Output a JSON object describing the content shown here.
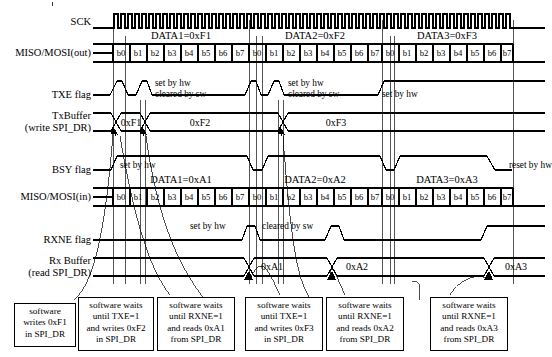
{
  "figure": {
    "type": "spi-timing-diagram"
  },
  "rows": [
    {
      "id": "sck",
      "label": "SCK",
      "sublabel": ""
    },
    {
      "id": "miso_out",
      "label": "MISO/MOSI(out)",
      "sublabel": ""
    },
    {
      "id": "txe",
      "label": "TXE flag",
      "sublabel": ""
    },
    {
      "id": "txbuffer",
      "label": "TxBuffer",
      "sublabel": "(write SPI_DR)"
    },
    {
      "id": "bsy",
      "label": "BSY flag",
      "sublabel": ""
    },
    {
      "id": "miso_in",
      "label": "MISO/MOSI(in)",
      "sublabel": ""
    },
    {
      "id": "rxne",
      "label": "RXNE flag",
      "sublabel": ""
    },
    {
      "id": "rxbuffer",
      "label": "Rx Buffer",
      "sublabel": "(read SPI_DR)"
    }
  ],
  "out_frames": [
    {
      "name": "DATA1=0xF1",
      "bits": [
        "b0",
        "b1",
        "b2",
        "b3",
        "b4",
        "b5",
        "b6",
        "b7"
      ]
    },
    {
      "name": "DATA2=0xF2",
      "bits": [
        "b0",
        "b1",
        "b2",
        "b3",
        "b4",
        "b5",
        "b6",
        "b7"
      ]
    },
    {
      "name": "DATA3=0xF3",
      "bits": [
        "b0",
        "b1",
        "b2",
        "b3",
        "b4",
        "b5",
        "b6",
        "b7"
      ]
    }
  ],
  "in_frames": [
    {
      "name": "DATA1=0xA1",
      "bits": [
        "b0",
        "b1",
        "b2",
        "b3",
        "b4",
        "b5",
        "b6",
        "b7"
      ]
    },
    {
      "name": "DATA2=0xA2",
      "bits": [
        "b0",
        "b1",
        "b2",
        "b3",
        "b4",
        "b5",
        "b6",
        "b7"
      ]
    },
    {
      "name": "DATA3=0xA3",
      "bits": [
        "b0",
        "b1",
        "b2",
        "b3",
        "b4",
        "b5",
        "b6",
        "b7"
      ]
    }
  ],
  "tx_buffer_values": [
    "0xF1",
    "0xF2",
    "0xF3"
  ],
  "rx_buffer_values": [
    "0xA1",
    "0xA2",
    "0xA3"
  ],
  "annotations": {
    "txe_1_line1": "set by hw",
    "txe_1_line2": "cleared by sw",
    "txe_2_line1": "set by hw",
    "txe_2_line2": "cleared by sw",
    "txe_3": "set by hw",
    "bsy_set": "set by hw",
    "bsy_reset": "reset by hw",
    "rxne_set": "set by hw",
    "rxne_cleared": "cleared by sw"
  },
  "callout_boxes": [
    {
      "id": "cb1",
      "lines": [
        "software",
        "writes 0xF1",
        "in SPI_DR"
      ]
    },
    {
      "id": "cb2",
      "lines": [
        "software waits",
        "until TXE=1",
        "and writes 0xF2",
        "in SPI_DR"
      ]
    },
    {
      "id": "cb3",
      "lines": [
        "software waits",
        "until RXNE=1",
        "and reads 0xA1",
        "from SPI_DR"
      ]
    },
    {
      "id": "cb4",
      "lines": [
        "software waits",
        "until TXE=1",
        "and writes 0xF3",
        "in SPI_DR"
      ]
    },
    {
      "id": "cb5",
      "lines": [
        "software waits",
        "until RXNE=1",
        "and reads 0xA2",
        "from SPI_DR"
      ]
    },
    {
      "id": "cb6",
      "lines": [
        "software waits",
        "until RXNE=1",
        "and reads 0xA3",
        "from SPI_DR"
      ]
    }
  ],
  "colors": {
    "line": "#000000",
    "background": "#ffffff"
  }
}
